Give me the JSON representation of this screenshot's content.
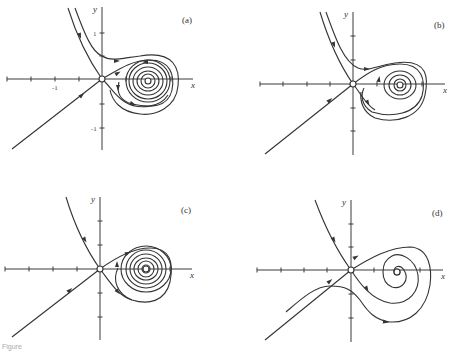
{
  "figure": {
    "caption_fragment": "Figure"
  },
  "chart_data": [
    {
      "type": "phase_portrait",
      "panel_label": "(a)",
      "xlabel": "x",
      "ylabel": "y",
      "tick_labels": {
        "x": [
          "-1"
        ],
        "y": [
          "1",
          "-1"
        ]
      },
      "origin_px": [
        102,
        79
      ],
      "unit_px": 47,
      "x_axis_px": [
        7,
        193
      ],
      "y_axis_px": [
        7,
        150
      ],
      "x_ticks_px": [
        7,
        31,
        55,
        79,
        126,
        171
      ],
      "y_ticks_px": [
        33,
        56,
        104,
        128
      ],
      "equilibria_px": [
        [
          102,
          79
        ],
        [
          148,
          81
        ]
      ],
      "trajectories": [
        "M68,8 C78,40 90,62 102,79",
        "M75,8 C85,35 92,52 102,56 C112,62 122,58 140,56 C175,50 180,70 178,86 C176,108 155,116 140,114 C120,112 112,100 110,90",
        "M12,149 L102,79",
        "M102,79 C115,72 130,60 150,60 C170,60 175,75 172,90 C168,108 150,108 132,104 C118,100 117,90 119,82",
        "M102,79 C110,86 115,96 125,102 C138,110 160,108 168,95",
        "M148,81 m-7,0 a7,7 0 1,0 14,0 a7,7 0 1,0 -14,0",
        "M148,81 m-11,0 a11,10 0 1,0 22,0 a11,10 0 1,0 -22,0",
        "M148,81 m-15,0 a15,14 0 1,0 30,0 a15,14 0 1,0 -30,0",
        "M148,81 m-19,0 a19,18 0 1,0 38,0 a19,18 0 1,0 -38,0",
        "M148,81 m-22,0 a22,21 0 1,0 44,0 a22,21 0 1,0 -44,0"
      ],
      "arrows_px": [
        [
          80,
          36,
          70
        ],
        [
          117,
          61,
          0
        ],
        [
          82,
          95,
          -40
        ],
        [
          118,
          73,
          -30
        ],
        [
          145,
          62,
          180
        ],
        [
          118,
          88,
          90
        ],
        [
          133,
          104,
          20
        ]
      ]
    },
    {
      "type": "phase_portrait",
      "panel_label": "(b)",
      "xlabel": "x",
      "ylabel": "y",
      "tick_labels": {
        "x": [],
        "y": []
      },
      "origin_px": [
        353,
        84
      ],
      "unit_px": 47,
      "x_axis_px": [
        260,
        445
      ],
      "y_axis_px": [
        12,
        155
      ],
      "x_ticks_px": [
        260,
        283,
        307,
        330,
        377,
        422
      ],
      "y_ticks_px": [
        36,
        60,
        108,
        131
      ],
      "equilibria_px": [
        [
          353,
          84
        ],
        [
          400,
          85
        ]
      ],
      "trajectories": [
        "M320,12 C330,45 342,68 353,84",
        "M326,12 C336,40 344,62 358,68 C368,72 375,66 395,63 C430,58 428,80 425,95 C420,118 395,124 375,118 C362,112 360,100 361,92",
        "M265,154 L353,84",
        "M353,84 C366,74 380,64 400,64 C422,64 426,80 422,96 C416,114 392,118 372,112 C362,106 360,96 364,88",
        "M353,84 C360,92 365,104 375,110",
        "M400,85 m-6,0 a6,6 0 1,0 12,0 a6,6 0 1,0 -12,0",
        "M400,85 m-11,0 a11,10 0 1,0 22,0 a11,10 0 1,0 -22,0",
        "M400,85 m-16,0 a16,14 0 1,0 32,0 a16,14 0 1,0 -32,0"
      ],
      "arrows_px": [
        [
          334,
          45,
          70
        ],
        [
          367,
          69,
          0
        ],
        [
          330,
          100,
          -40
        ],
        [
          379,
          79,
          -80
        ],
        [
          368,
          103,
          60
        ]
      ]
    },
    {
      "type": "phase_portrait",
      "panel_label": "(c)",
      "xlabel": "x",
      "ylabel": "y",
      "tick_labels": {
        "x": [],
        "y": []
      },
      "origin_px": [
        100,
        269
      ],
      "unit_px": 47,
      "x_axis_px": [
        5,
        192
      ],
      "y_axis_px": [
        197,
        340
      ],
      "x_ticks_px": [
        5,
        29,
        53,
        77,
        170
      ],
      "y_ticks_px": [
        221,
        245,
        293,
        317
      ],
      "equilibria_px": [
        [
          100,
          269
        ],
        [
          146,
          269
        ]
      ],
      "trajectories": [
        "M66,197 C76,230 88,252 100,269",
        "M12,337 L100,269",
        "M100,269 C118,256 135,248 150,248 C170,248 174,262 170,282 C165,302 148,305 132,300 C117,294 112,280 118,268",
        "M100,269 C110,282 118,296 132,300",
        "M146,269 m-4,0 a4,4 0 1,0 8,0 a4,4 0 1,0 -8,0",
        "M146,269 m-8,0 a8,8 0 1,0 16,0 a8,8 0 1,0 -16,0",
        "M146,269 m-12,0 a12,11 0 1,0 24,0 a12,11 0 1,0 -24,0",
        "M146,269 m-16,0 a16,15 0 1,0 32,0 a16,15 0 1,0 -32,0",
        "M146,269 m-20,0 a20,19 0 1,0 40,0 a20,19 0 1,0 -40,0",
        "M146,269 m-25,0 a25,23 0 1,0 50,0 a25,23 0 1,0 -50,0"
      ],
      "arrows_px": [
        [
          85,
          240,
          60
        ],
        [
          70,
          290,
          -40
        ],
        [
          128,
          253,
          -20
        ],
        [
          117,
          264,
          -90
        ],
        [
          118,
          292,
          50
        ]
      ]
    },
    {
      "type": "phase_portrait",
      "panel_label": "(d)",
      "xlabel": "x",
      "ylabel": "y",
      "tick_labels": {
        "x": [],
        "y": []
      },
      "origin_px": [
        351,
        270
      ],
      "unit_px": 47,
      "x_axis_px": [
        257,
        443
      ],
      "y_axis_px": [
        200,
        342
      ],
      "x_ticks_px": [
        257,
        281,
        304,
        327,
        374,
        420
      ],
      "y_ticks_px": [
        224,
        247,
        294,
        318
      ],
      "equilibria_px": [
        [
          351,
          270
        ],
        [
          397,
          272
        ]
      ],
      "trajectories": [
        "M315,200 C327,232 340,255 351,270",
        "M265,340 L351,270",
        "M351,270 C370,258 390,247 410,247 C430,248 432,270 430,285 C426,310 410,323 390,322 C375,320 368,312 360,300 C352,290 346,286 330,286 C315,286 300,300 286,312",
        "M351,270 C360,284 372,300 390,303 C410,305 420,290 418,275 C415,258 400,252 392,256 C380,262 380,282 392,287 C402,290 410,280 404,270 C400,264 394,266 394,272",
        "M397,272 m-3,0 a3,3 0 1,0 6,0 a3,3 0 1,0 -6,0"
      ],
      "arrows_px": [
        [
          334,
          240,
          60
        ],
        [
          356,
          257,
          -30
        ],
        [
          330,
          281,
          -40
        ],
        [
          367,
          289,
          60
        ],
        [
          386,
          322,
          10
        ]
      ]
    }
  ]
}
